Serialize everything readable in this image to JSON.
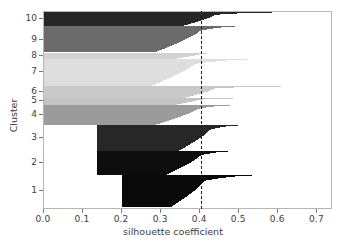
{
  "chart_data": {
    "type": "area",
    "title": "",
    "xlabel": "silhouette coefficient",
    "ylabel": "Cluster",
    "xlim": [
      0.0,
      0.74
    ],
    "ylim": [
      0,
      10
    ],
    "grid": false,
    "legend": null,
    "xticks": [
      "0.0",
      "0.1",
      "0.2",
      "0.3",
      "0.4",
      "0.5",
      "0.6",
      "0.7"
    ],
    "xtick_values": [
      0.0,
      0.1,
      0.2,
      0.3,
      0.4,
      0.5,
      0.6,
      0.7
    ],
    "yticks": [
      "1",
      "2",
      "3",
      "4",
      "5",
      "6",
      "7",
      "8",
      "9",
      "10"
    ],
    "ytick_values": [
      1,
      2,
      3,
      4,
      5,
      6,
      7,
      8,
      9,
      10
    ],
    "annotations": [
      {
        "name": "mean-silhouette-threshold",
        "type": "vline",
        "value": 0.404,
        "style": "dashed",
        "color": "#1a1a1a"
      }
    ],
    "clusters": [
      {
        "label": "10",
        "color": "#262626",
        "y_top": 0.0,
        "y_bottom": 0.073,
        "start": 0.0,
        "max": 0.64,
        "min": 0.35,
        "knee": 0.44
      },
      {
        "label": "9",
        "color": "#6b6b6b",
        "y_top": 0.073,
        "y_bottom": 0.205,
        "start": 0.0,
        "max": 0.512,
        "min": 0.285,
        "knee": 0.4
      },
      {
        "label": "8",
        "color": "#d2d2d2",
        "y_top": 0.205,
        "y_bottom": 0.236,
        "start": 0.0,
        "max": 0.432,
        "min": 0.33,
        "knee": 0.4
      },
      {
        "label": "7",
        "color": "#dedede",
        "y_top": 0.236,
        "y_bottom": 0.372,
        "start": 0.0,
        "max": 0.555,
        "min": 0.275,
        "knee": 0.385
      },
      {
        "label": "6",
        "color": "#c9c9c9",
        "y_top": 0.372,
        "y_bottom": 0.432,
        "start": 0.0,
        "max": 0.685,
        "min": 0.36,
        "knee": 0.44
      },
      {
        "label": "5",
        "color": "#c4c4c4",
        "y_top": 0.432,
        "y_bottom": 0.47,
        "start": 0.0,
        "max": 0.545,
        "min": 0.325,
        "knee": 0.4
      },
      {
        "label": "4",
        "color": "#9b9b9b",
        "y_top": 0.47,
        "y_bottom": 0.57,
        "start": 0.0,
        "max": 0.502,
        "min": 0.285,
        "knee": 0.395
      },
      {
        "label": "3",
        "color": "#272727",
        "y_top": 0.57,
        "y_bottom": 0.7,
        "start": 0.135,
        "max": 0.515,
        "min": 0.345,
        "knee": 0.425
      },
      {
        "label": "2",
        "color": "#0d0d0d",
        "y_top": 0.7,
        "y_bottom": 0.823,
        "start": 0.135,
        "max": 0.492,
        "min": 0.31,
        "knee": 0.4
      },
      {
        "label": "1",
        "color": "#090909",
        "y_top": 0.823,
        "y_bottom": 0.985,
        "start": 0.2,
        "max": 0.562,
        "min": 0.325,
        "knee": 0.41
      }
    ]
  },
  "axes": {
    "x_label": "silhouette coefficient",
    "y_label": "Cluster"
  },
  "colors": {
    "frame": "#b5b5b5",
    "tick": "#7a7a7a",
    "text": "#3d3d3d",
    "background": "#ffffff",
    "threshold": "#1a1a1a"
  }
}
